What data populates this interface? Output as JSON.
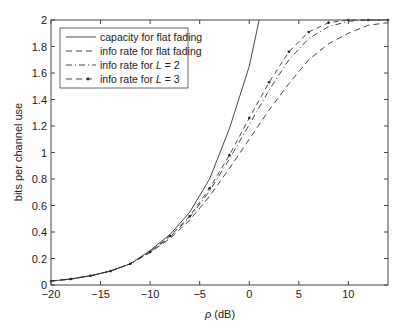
{
  "chart_data": {
    "type": "line",
    "title": "",
    "xlabel": "ρ (dB)",
    "ylabel": "bits per channel use",
    "xlim": [
      -20,
      14
    ],
    "ylim": [
      0,
      2
    ],
    "xticks": [
      -20,
      -15,
      -10,
      -5,
      0,
      5,
      10
    ],
    "yticks": [
      0,
      0.2,
      0.4,
      0.6,
      0.8,
      1,
      1.2,
      1.4,
      1.6,
      1.8,
      2
    ],
    "grid": false,
    "legend_position": "upper left",
    "series": [
      {
        "name": "capacity for flat fading",
        "style": "solid",
        "x": [
          -20,
          -18,
          -16,
          -14,
          -12,
          -10,
          -8,
          -6,
          -4,
          -2,
          0,
          1
        ],
        "y": [
          0.03,
          0.045,
          0.07,
          0.105,
          0.16,
          0.26,
          0.38,
          0.55,
          0.8,
          1.18,
          1.65,
          2.0
        ]
      },
      {
        "name": "info rate for flat fading",
        "style": "dashed",
        "x": [
          -20,
          -18,
          -16,
          -14,
          -12,
          -10,
          -8,
          -6,
          -4,
          -2,
          0,
          2,
          4,
          6,
          8,
          10,
          12,
          14
        ],
        "y": [
          0.03,
          0.045,
          0.07,
          0.105,
          0.16,
          0.245,
          0.35,
          0.49,
          0.67,
          0.88,
          1.1,
          1.32,
          1.52,
          1.7,
          1.82,
          1.9,
          1.96,
          1.98
        ]
      },
      {
        "name": "info rate for L = 2",
        "style": "dashdot",
        "x": [
          -20,
          -18,
          -16,
          -14,
          -12,
          -10,
          -8,
          -6,
          -4,
          -2,
          0,
          2,
          4,
          6,
          8,
          10,
          12,
          14
        ],
        "y": [
          0.03,
          0.045,
          0.07,
          0.105,
          0.16,
          0.25,
          0.36,
          0.51,
          0.71,
          0.95,
          1.21,
          1.47,
          1.7,
          1.86,
          1.95,
          1.99,
          2.0,
          2.0
        ]
      },
      {
        "name": "info rate for L = 3",
        "style": "dash-dot-marker",
        "x": [
          -20,
          -18,
          -16,
          -14,
          -12,
          -10,
          -8,
          -6,
          -4,
          -2,
          0,
          2,
          4,
          6,
          8,
          10,
          12,
          14
        ],
        "y": [
          0.03,
          0.045,
          0.07,
          0.105,
          0.16,
          0.25,
          0.37,
          0.52,
          0.73,
          0.98,
          1.26,
          1.53,
          1.76,
          1.91,
          1.98,
          2.0,
          2.0,
          2.0
        ]
      }
    ]
  },
  "legend": {
    "items": [
      {
        "prefix": "capacity for flat fading",
        "italic": ""
      },
      {
        "prefix": "info rate for flat fading",
        "italic": ""
      },
      {
        "prefix": "info rate for ",
        "italic": "L",
        "suffix": " = 2"
      },
      {
        "prefix": "info rate for ",
        "italic": "L",
        "suffix": " = 3"
      }
    ]
  },
  "axes": {
    "xlabel_rho": "ρ",
    "xlabel_unit": " (dB)"
  }
}
